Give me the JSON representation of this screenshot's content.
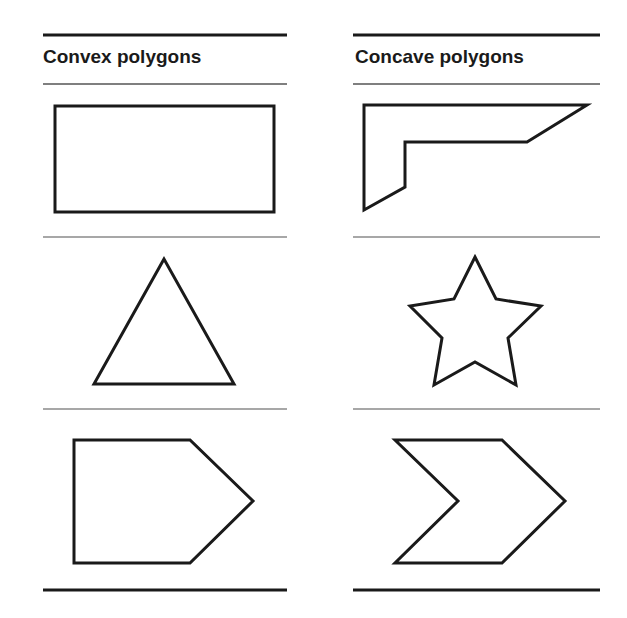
{
  "columns": [
    {
      "title": "Convex polygons",
      "x": 43,
      "shapes": [
        {
          "name": "rectangle",
          "points": "55,106 274,106 274,212 55,212"
        },
        {
          "name": "triangle",
          "points": "164,259 94,384 234,384"
        },
        {
          "name": "pentagon",
          "points": "74,440 190,440 253,501 190,563 74,563"
        }
      ]
    },
    {
      "title": "Concave polygons",
      "x": 355,
      "shapes": [
        {
          "name": "l-shape",
          "points": "364,105 587,105 527,142 405,142 405,187 364,210"
        },
        {
          "name": "star",
          "points": "475,257 496,299 541,306 508,338 516,385 475,362 434,385 442,338 410,306 454,299"
        },
        {
          "name": "chevron",
          "points": "395,440 502,440 565,501 502,563 395,563 458,501"
        }
      ]
    }
  ],
  "colors": {
    "stroke": "#1a1a1a",
    "rule_thin": "#8a8a8a"
  }
}
